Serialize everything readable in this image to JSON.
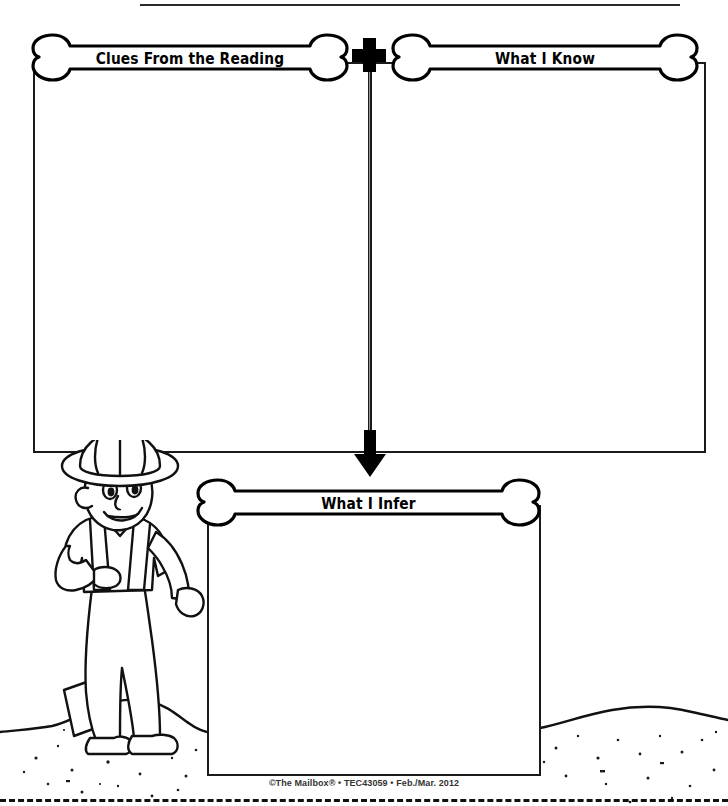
{
  "worksheet": {
    "title": "Making Inferences Graphic Organizer",
    "width": 728,
    "height": 806,
    "ink_color": "#000000",
    "paper_color": "#ffffff",
    "connector_color": "#9a9a9a"
  },
  "boxes": {
    "clues": {
      "label": "Clues From the Reading",
      "value": ""
    },
    "know": {
      "label": "What I Know",
      "value": ""
    },
    "infer": {
      "label": "What I Infer",
      "value": ""
    }
  },
  "operators": {
    "plus": "+",
    "arrow": "down-arrow"
  },
  "illustration": {
    "character": "archaeologist-with-shovel",
    "ground": "dirt-mound"
  },
  "footer": {
    "credit": "©The Mailbox® • TEC43059 • Feb./Mar. 2012"
  }
}
